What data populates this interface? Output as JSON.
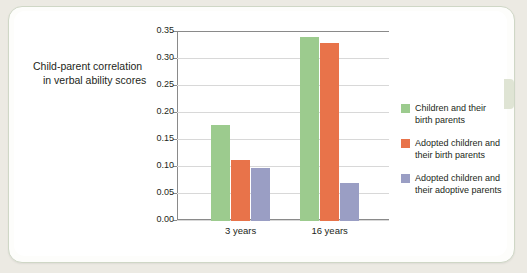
{
  "caption": {
    "line1": "Child-parent correlation",
    "line2": "in verbal ability scores"
  },
  "legend": [
    {
      "label_line1": "Children and their",
      "label_line2": "birth parents",
      "color": "#9ccb8e"
    },
    {
      "label_line1": "Adopted children and",
      "label_line2": "their birth parents",
      "color": "#e8734a"
    },
    {
      "label_line1": "Adopted children and",
      "label_line2": "their adoptive parents",
      "color": "#9a9ec4"
    }
  ],
  "chart_data": {
    "type": "bar",
    "title": "",
    "xlabel": "",
    "ylabel": "Child-parent correlation in verbal ability scores",
    "categories": [
      "3 years",
      "16 years"
    ],
    "ylim": [
      0.0,
      0.35
    ],
    "ytick_labels": [
      "0.00",
      "0.05",
      "0.10",
      "0.15",
      "0.20",
      "0.25",
      "0.30",
      "0.35"
    ],
    "ytick_values": [
      0.0,
      0.05,
      0.1,
      0.15,
      0.2,
      0.25,
      0.3,
      0.35
    ],
    "grid": true,
    "legend_position": "right",
    "series": [
      {
        "name": "Children and their birth parents",
        "color": "#9ccb8e",
        "values": [
          0.177,
          0.341
        ]
      },
      {
        "name": "Adopted children and their birth parents",
        "color": "#e8734a",
        "values": [
          0.113,
          0.329
        ]
      },
      {
        "name": "Adopted children and their adoptive parents",
        "color": "#9a9ec4",
        "values": [
          0.098,
          0.071
        ]
      }
    ]
  }
}
